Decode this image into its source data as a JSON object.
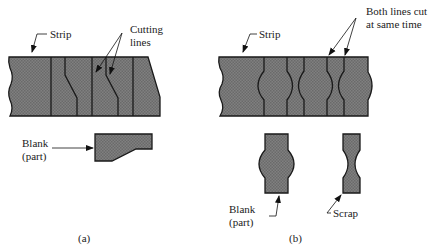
{
  "panel_a": {
    "strip_label": "Strip",
    "cutting_label_1": "Cutting",
    "cutting_label_2": "lines",
    "blank_label_1": "Blank",
    "blank_label_2": "(part)",
    "caption": "(a)"
  },
  "panel_b": {
    "strip_label": "Strip",
    "cut_label_1": "Both lines cut",
    "cut_label_2": "at same time",
    "blank_label_1": "Blank",
    "blank_label_2": "(part)",
    "scrap_label": "Scrap",
    "caption": "(b)"
  },
  "colors": {
    "fill": "#7a7a7a",
    "stroke": "#1a1a1a"
  }
}
